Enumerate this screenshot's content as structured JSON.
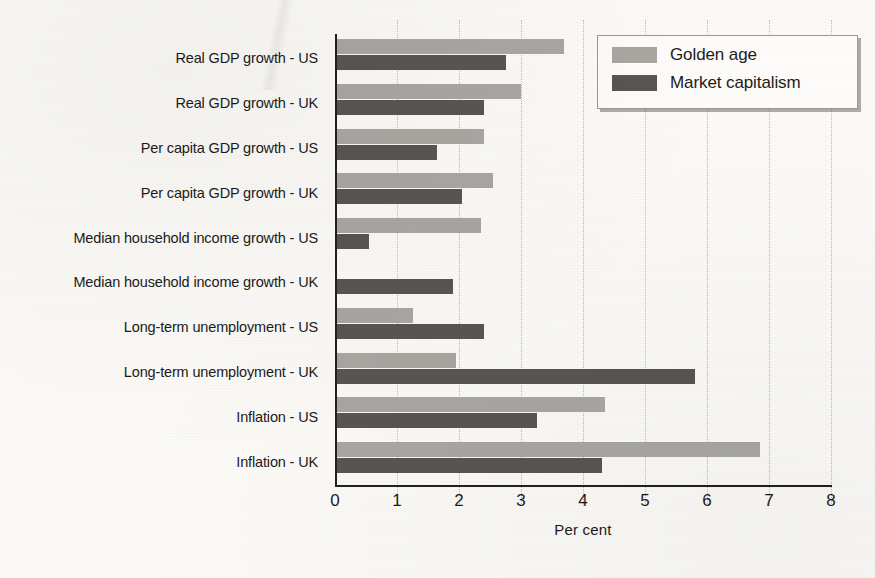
{
  "chart_data": {
    "type": "bar",
    "orientation": "horizontal",
    "title": "",
    "xlabel": "Per cent",
    "ylabel": "",
    "xlim": [
      0,
      8
    ],
    "xticks": [
      "0",
      "1",
      "2",
      "3",
      "4",
      "5",
      "6",
      "7",
      "8"
    ],
    "grid": "vertical dotted",
    "legend_position": "top-right",
    "categories": [
      "Real GDP growth - US",
      "Real GDP growth - UK",
      "Per capita GDP growth - US",
      "Per capita GDP growth - UK",
      "Median household income growth - US",
      "Median household income growth - UK",
      "Long-term unemployment - US",
      "Long-term unemployment - UK",
      "Inflation - US",
      "Inflation - UK"
    ],
    "series": [
      {
        "name": "Golden age",
        "color": "#a9a7a2",
        "values": [
          3.7,
          3.0,
          2.4,
          2.55,
          2.35,
          0.0,
          1.25,
          1.95,
          4.35,
          6.85
        ]
      },
      {
        "name": "Market capitalism",
        "color": "#585553",
        "values": [
          2.75,
          2.4,
          1.65,
          2.05,
          0.55,
          1.9,
          2.4,
          5.8,
          3.25,
          4.3
        ]
      }
    ]
  },
  "legend": {
    "items": [
      {
        "label": "Golden age",
        "swatch": "golden"
      },
      {
        "label": "Market capitalism",
        "swatch": "market"
      }
    ]
  },
  "axis": {
    "x_title": "Per cent"
  },
  "colors": {
    "golden_age": "#a9a7a2",
    "market_capitalism": "#585553",
    "axis": "#23211f",
    "gridline": "#bdbab3",
    "paper": "#fbfaf7"
  }
}
